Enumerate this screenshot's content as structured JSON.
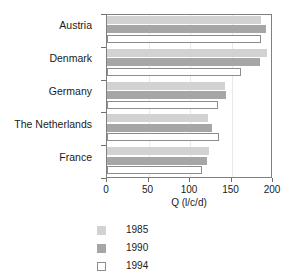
{
  "chart_data": {
    "type": "bar",
    "orientation": "horizontal",
    "title": "",
    "xlabel": "Q (l/c/d)",
    "ylabel": "",
    "xlim": [
      0,
      200
    ],
    "xticks": [
      0,
      50,
      100,
      150,
      200
    ],
    "xtick_labels": [
      "0",
      "50",
      "100",
      "150",
      "200"
    ],
    "grid": true,
    "legend_position": "bottom-left",
    "categories": [
      "Austria",
      "Denmark",
      "Germany",
      "The Netherlands",
      "France"
    ],
    "series": [
      {
        "name": "1985",
        "color": "#d2d2d2",
        "values": [
          185,
          193,
          142,
          122,
          123
        ]
      },
      {
        "name": "1990",
        "color": "#a6a6a6",
        "values": [
          191,
          184,
          143,
          127,
          121
        ]
      },
      {
        "name": "1994",
        "color": "#ffffff",
        "values": [
          185,
          161,
          134,
          135,
          114
        ]
      }
    ]
  },
  "axis": {
    "x_title": "Q (l/c/d)"
  },
  "legend": {
    "items": [
      {
        "label": "1985"
      },
      {
        "label": "1990"
      },
      {
        "label": "1994"
      }
    ]
  }
}
